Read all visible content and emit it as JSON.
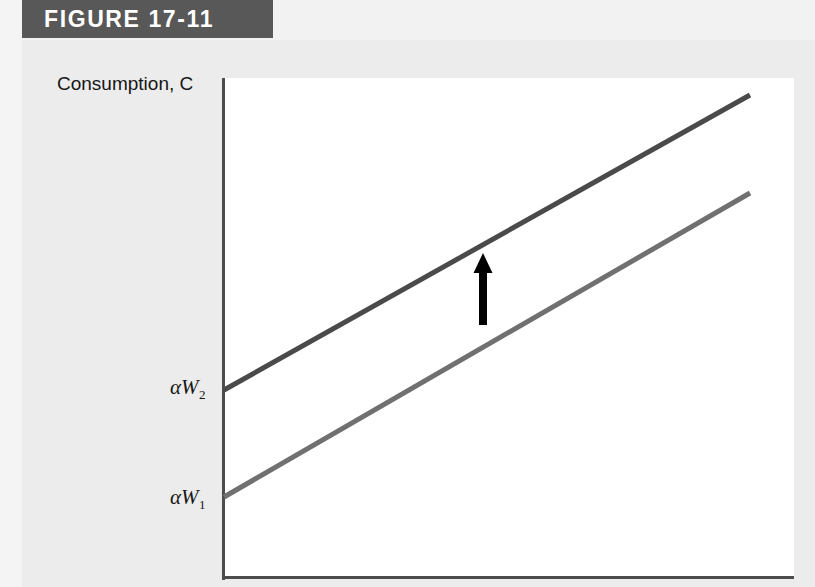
{
  "figure": {
    "banner_label": "FIGURE 17-11",
    "banner_color": "#585858",
    "banner_text_color": "#ffffff"
  },
  "page": {
    "background_color": "#ececec",
    "plot_background_color": "#ffffff"
  },
  "chart_data": {
    "type": "line",
    "title": "FIGURE 17-11",
    "xlabel": "",
    "ylabel": "Consumption, C",
    "grid": false,
    "legend_position": "none",
    "axis_color": "#4d4d4d",
    "annotations": [
      {
        "name": "shift-arrow",
        "kind": "arrow",
        "direction": "up",
        "color": "#000000",
        "x": 483,
        "y_start": 325,
        "y_end": 253
      }
    ],
    "series": [
      {
        "name": "Consumption function, higher wealth",
        "intercept_label": "αW₂",
        "intercept_label_alpha": "α",
        "intercept_label_base": "W",
        "intercept_label_sub": "2",
        "color": "#4a4a4a",
        "line_width": 5,
        "x": [
          224,
          750
        ],
        "y": [
          390,
          95
        ]
      },
      {
        "name": "Consumption function, lower wealth",
        "intercept_label": "αW₁",
        "intercept_label_alpha": "α",
        "intercept_label_base": "W",
        "intercept_label_sub": "1",
        "color": "#707070",
        "line_width": 5,
        "x": [
          224,
          750
        ],
        "y": [
          497,
          193
        ]
      }
    ],
    "axis_labels": {
      "y_axis_title": "Consumption, C"
    }
  }
}
